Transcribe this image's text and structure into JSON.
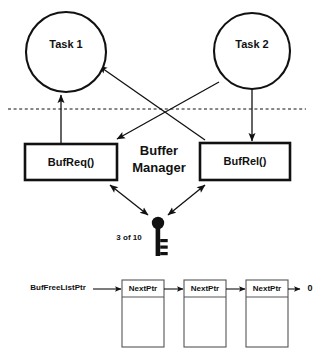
{
  "diagram": {
    "title": "Buffer Manager",
    "tasks": [
      {
        "id": "task-1",
        "label": "Task 1"
      },
      {
        "id": "task-2",
        "label": "Task 2"
      }
    ],
    "functions": [
      {
        "id": "bufreq",
        "label": "BufReq()"
      },
      {
        "id": "bufrel",
        "label": "BufRel()"
      }
    ],
    "manager": {
      "line1": "Buffer",
      "line2": "Manager"
    },
    "semaphore": {
      "icon": "key-icon",
      "count_label": "3 of 10"
    },
    "free_list": {
      "pointer_label": "BufFreeListPtr",
      "nodes": [
        {
          "field": "NextPtr"
        },
        {
          "field": "NextPtr"
        },
        {
          "field": "NextPtr"
        }
      ],
      "terminator": "0"
    },
    "separator": {
      "name": "kernel-user-boundary",
      "style": "dashed"
    },
    "colors": {
      "ink": "#111111",
      "cell_stroke": "#555555",
      "background": "#ffffff"
    }
  }
}
